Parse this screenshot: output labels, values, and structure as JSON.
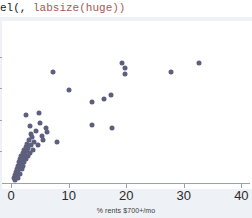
{
  "code_line": {
    "plain_prefix": "el(, ",
    "option_text": "labsize(huge))"
  },
  "colors": {
    "marker": "#5e5f7e",
    "axis": "#9aa2ab",
    "plot_background": "#ffffff",
    "page_background": "#eef1f5",
    "code_option": "#a45a52",
    "code_plain": "#1a1a1a"
  },
  "chart_data": {
    "type": "scatter",
    "title": "",
    "xlabel": "% rents $700+/mo",
    "ylabel": "",
    "xlim": [
      -1.6,
      41.5
    ],
    "ylim": [
      0,
      100
    ],
    "xticks": [
      0,
      10,
      20,
      30,
      40
    ],
    "xticklabels": [
      "0",
      "10",
      "20",
      "30",
      "40"
    ],
    "yticks": [
      20,
      40,
      60,
      80
    ],
    "yticklabels": [
      "",
      "",
      "",
      ""
    ],
    "grid": false,
    "legend": false,
    "marker_size": 5,
    "points": [
      {
        "x": 0.5,
        "y": 3
      },
      {
        "x": 0.6,
        "y": 5
      },
      {
        "x": 0.7,
        "y": 2
      },
      {
        "x": 0.8,
        "y": 7
      },
      {
        "x": 0.9,
        "y": 4
      },
      {
        "x": 1.0,
        "y": 9
      },
      {
        "x": 1.0,
        "y": 6
      },
      {
        "x": 1.1,
        "y": 11
      },
      {
        "x": 1.2,
        "y": 8
      },
      {
        "x": 1.2,
        "y": 3
      },
      {
        "x": 1.3,
        "y": 13
      },
      {
        "x": 1.4,
        "y": 10
      },
      {
        "x": 1.5,
        "y": 15
      },
      {
        "x": 1.5,
        "y": 6
      },
      {
        "x": 1.6,
        "y": 12
      },
      {
        "x": 1.7,
        "y": 17
      },
      {
        "x": 1.8,
        "y": 9
      },
      {
        "x": 1.9,
        "y": 14
      },
      {
        "x": 2.0,
        "y": 19
      },
      {
        "x": 2.0,
        "y": 11
      },
      {
        "x": 2.1,
        "y": 16
      },
      {
        "x": 2.2,
        "y": 21
      },
      {
        "x": 2.3,
        "y": 13
      },
      {
        "x": 2.4,
        "y": 18
      },
      {
        "x": 2.5,
        "y": 23
      },
      {
        "x": 2.6,
        "y": 15
      },
      {
        "x": 2.7,
        "y": 20
      },
      {
        "x": 2.8,
        "y": 25
      },
      {
        "x": 2.9,
        "y": 17
      },
      {
        "x": 3.0,
        "y": 22
      },
      {
        "x": 3.1,
        "y": 27
      },
      {
        "x": 3.2,
        "y": 19
      },
      {
        "x": 3.4,
        "y": 24
      },
      {
        "x": 3.6,
        "y": 29
      },
      {
        "x": 3.8,
        "y": 21
      },
      {
        "x": 2.6,
        "y": 43
      },
      {
        "x": 3.2,
        "y": 36
      },
      {
        "x": 3.4,
        "y": 31
      },
      {
        "x": 3.9,
        "y": 26
      },
      {
        "x": 4.3,
        "y": 33
      },
      {
        "x": 4.6,
        "y": 24
      },
      {
        "x": 4.9,
        "y": 44
      },
      {
        "x": 5.0,
        "y": 38
      },
      {
        "x": 5.3,
        "y": 30
      },
      {
        "x": 5.6,
        "y": 27
      },
      {
        "x": 6.0,
        "y": 35
      },
      {
        "x": 6.3,
        "y": 32
      },
      {
        "x": 7.3,
        "y": 70
      },
      {
        "x": 7.9,
        "y": 26
      },
      {
        "x": 10.0,
        "y": 59
      },
      {
        "x": 14.0,
        "y": 51
      },
      {
        "x": 14.1,
        "y": 37
      },
      {
        "x": 16.2,
        "y": 53
      },
      {
        "x": 17.4,
        "y": 56
      },
      {
        "x": 17.5,
        "y": 35
      },
      {
        "x": 19.2,
        "y": 76
      },
      {
        "x": 19.8,
        "y": 73
      },
      {
        "x": 19.8,
        "y": 69
      },
      {
        "x": 27.8,
        "y": 70
      },
      {
        "x": 32.6,
        "y": 76
      }
    ]
  }
}
